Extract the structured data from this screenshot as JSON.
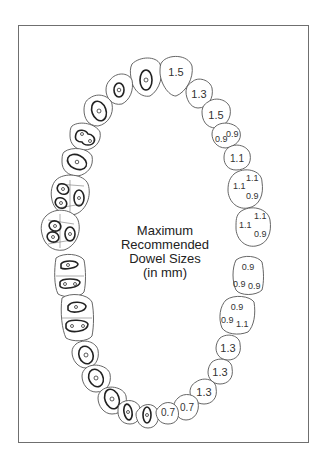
{
  "diagram": {
    "title_lines": [
      "Maximum",
      "Recommended",
      "Dowel Sizes",
      "(in mm)"
    ],
    "frame_color": "#6f6f6f",
    "upper_arch_right_labels": [
      {
        "tooth": "central incisor",
        "values": [
          "1.5"
        ]
      },
      {
        "tooth": "lateral incisor",
        "values": [
          "1.3"
        ]
      },
      {
        "tooth": "canine",
        "values": [
          "1.5"
        ]
      },
      {
        "tooth": "first premolar",
        "values": [
          "0.9",
          "0.9"
        ]
      },
      {
        "tooth": "second premolar",
        "values": [
          "1.1"
        ]
      },
      {
        "tooth": "first molar",
        "values": [
          "1.1",
          "1.1",
          "0.9"
        ]
      },
      {
        "tooth": "second molar",
        "values": [
          "1.1",
          "1.1",
          "0.9"
        ]
      }
    ],
    "lower_arch_right_labels": [
      {
        "tooth": "second molar",
        "values": [
          "0.9",
          "0.9",
          "0.9"
        ]
      },
      {
        "tooth": "first molar",
        "values": [
          "0.9",
          "0.9",
          "1.1"
        ]
      },
      {
        "tooth": "second premolar",
        "values": [
          "1.3"
        ]
      },
      {
        "tooth": "first premolar",
        "values": [
          "1.3"
        ]
      },
      {
        "tooth": "canine",
        "values": [
          "1.3"
        ]
      },
      {
        "tooth": "lateral incisor",
        "values": [
          "0.7"
        ]
      },
      {
        "tooth": "central incisor",
        "values": [
          "0.7"
        ]
      }
    ],
    "text": {
      "u1": "1.5",
      "u2": "1.3",
      "u3": "1.5",
      "u4a": "0.9",
      "u4b": "0.9",
      "u5": "1.1",
      "u6a": "1.1",
      "u6b": "1.1",
      "u6c": "0.9",
      "u7a": "1.1",
      "u7b": "1.1",
      "u7c": "0.9",
      "l7a": "0.9",
      "l7b": "0.9",
      "l7c": "0.9",
      "l6a": "0.9",
      "l6b": "0.9",
      "l6c": "1.1",
      "l5": "1.3",
      "l4": "1.3",
      "l3": "1.3",
      "l2": "0.7",
      "l1": "0.7"
    }
  }
}
